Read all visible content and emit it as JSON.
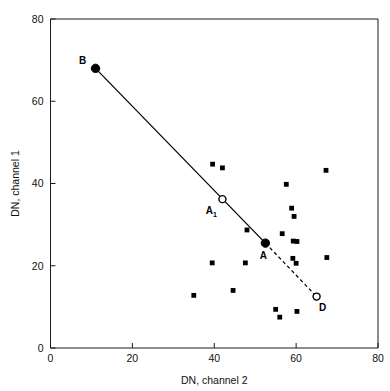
{
  "chart_data": {
    "type": "scatter",
    "title": "",
    "xlabel": "DN, channel 2",
    "ylabel": "DN, channel 1",
    "xlim": [
      0,
      80
    ],
    "ylim": [
      0,
      80
    ],
    "xticks": [
      0,
      20,
      40,
      60,
      80
    ],
    "yticks": [
      0,
      20,
      40,
      60,
      80
    ],
    "xtick_labels": [
      "0",
      "20",
      "40",
      "60",
      "80"
    ],
    "ytick_labels": [
      "0",
      "20",
      "40",
      "60",
      "80"
    ],
    "grid": false,
    "legend": null,
    "series": [
      {
        "name": "pixel-observations",
        "marker": "filled-square",
        "points": [
          {
            "x": 35.0,
            "y": 12.8
          },
          {
            "x": 39.6,
            "y": 44.7
          },
          {
            "x": 39.5,
            "y": 20.7
          },
          {
            "x": 42.0,
            "y": 43.8
          },
          {
            "x": 44.6,
            "y": 14.0
          },
          {
            "x": 47.6,
            "y": 20.7
          },
          {
            "x": 48.0,
            "y": 28.7
          },
          {
            "x": 55.0,
            "y": 9.4
          },
          {
            "x": 56.0,
            "y": 7.5
          },
          {
            "x": 56.6,
            "y": 27.8
          },
          {
            "x": 57.6,
            "y": 39.8
          },
          {
            "x": 58.9,
            "y": 34.0
          },
          {
            "x": 59.2,
            "y": 21.8
          },
          {
            "x": 59.3,
            "y": 26.0
          },
          {
            "x": 59.5,
            "y": 32.0
          },
          {
            "x": 60.2,
            "y": 25.9
          },
          {
            "x": 60.0,
            "y": 20.6
          },
          {
            "x": 60.2,
            "y": 8.9
          },
          {
            "x": 67.3,
            "y": 43.2
          },
          {
            "x": 67.5,
            "y": 22.0
          }
        ]
      }
    ],
    "mixing_line": {
      "solid_segment": {
        "from": "B",
        "to": "A"
      },
      "dashed_segment": {
        "from": "A",
        "to": "D"
      },
      "endpoints": [
        {
          "id": "B",
          "label": "B",
          "subscript": "",
          "x": 11.0,
          "y": 68.0,
          "marker": "filled-circle",
          "label_dx": -13,
          "label_dy": -4
        },
        {
          "id": "A1",
          "label": "A",
          "subscript": "1",
          "x": 42.0,
          "y": 36.2,
          "marker": "open-circle",
          "label_dx": -13,
          "label_dy": 15
        },
        {
          "id": "A",
          "label": "A",
          "subscript": "",
          "x": 52.5,
          "y": 25.5,
          "marker": "filled-circle",
          "label_dx": -2,
          "label_dy": 16
        },
        {
          "id": "D",
          "label": "D",
          "subscript": "",
          "x": 65.0,
          "y": 12.5,
          "marker": "open-circle",
          "label_dx": 6,
          "label_dy": 14
        }
      ]
    }
  }
}
